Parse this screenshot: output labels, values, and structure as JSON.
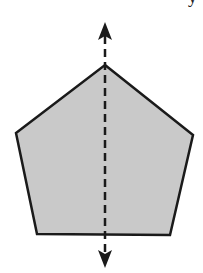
{
  "diagram": {
    "shape": {
      "type": "pentagon",
      "vertices": [
        [
          105,
          65
        ],
        [
          193,
          135
        ],
        [
          170,
          235
        ],
        [
          37,
          234
        ],
        [
          16,
          133
        ]
      ],
      "fill": "#c9c9c9",
      "stroke": "#1a1a1a",
      "stroke_width": 2.5
    },
    "symmetry_line": {
      "style": "dashed",
      "x": 105,
      "y_start": 34,
      "y_end": 262,
      "color": "#1a1a1a",
      "dash": "8 5",
      "arrowheads": [
        "up",
        "down"
      ]
    },
    "corner_fragment": "y"
  }
}
